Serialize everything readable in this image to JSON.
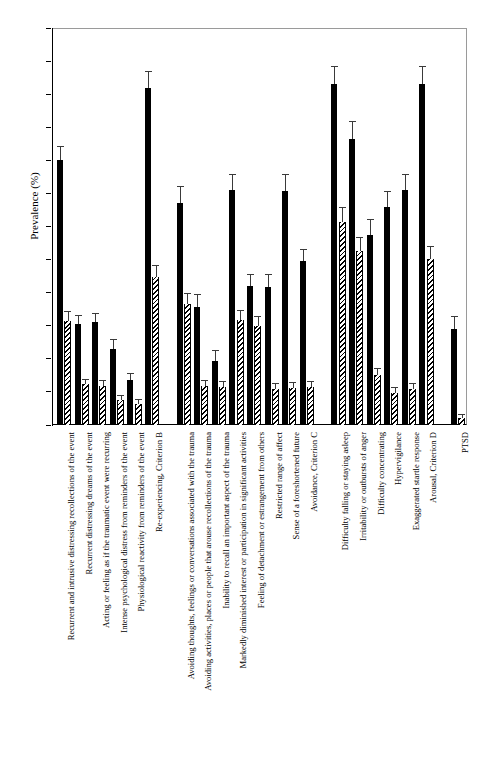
{
  "chart_data": {
    "type": "bar",
    "title": "",
    "xlabel": "",
    "ylabel": "Prevalence (%)",
    "ylim": [
      0,
      24
    ],
    "ytick_step": 2,
    "yticks": [
      0,
      2,
      4,
      6,
      8,
      10,
      12,
      14,
      16,
      18,
      20,
      22,
      24
    ],
    "grid": false,
    "legend": "none",
    "orientation": "vertical",
    "error_bars": "standard error (whisker with top cap)",
    "categories": [
      "Recurrent and intrusive distressing recollections of the event",
      "Recurrent distressing dreams of the event",
      "Acting or feeling as if the traumatic event were recurring",
      "Intense psychological distress from reminders of the event",
      "Physiological reactivity from reminders of the event",
      "Re-experiencing, Criterion B",
      "Avoiding thoughts, feelings or conversations associated with the trauma",
      "Avoiding activities, places or people that arouse recollections of the trauma",
      "Inability to recall an important aspect of the trauma",
      "Markedly diminished interest or participation in significant activities",
      "Feeling of detachment or estrangement from others",
      "Restricted range of affect",
      "Sense of a foreshortened future",
      "Avoidance, Criterion C",
      "Difficulty falling or staying asleep",
      "Irritability or outbursts of anger",
      "Difficulty concentrating",
      "Hypervigilance",
      "Exaggerated startle response",
      "Arousal, Criterion D",
      "PTSD"
    ],
    "series": [
      {
        "name": "solid-black-series",
        "fill": "solid",
        "values": [
          16.0,
          6.1,
          6.2,
          4.6,
          2.7,
          20.4,
          13.45,
          7.15,
          3.85,
          14.2,
          8.4,
          8.35,
          14.15,
          9.9,
          20.6,
          17.3,
          11.5,
          13.2,
          14.2,
          20.6,
          5.8
        ],
        "errors": [
          0.85,
          0.55,
          0.6,
          0.6,
          0.45,
          1.0,
          1.0,
          0.75,
          0.7,
          1.0,
          0.75,
          0.8,
          1.05,
          0.75,
          1.1,
          1.05,
          0.95,
          0.95,
          1.0,
          1.1,
          0.8
        ]
      },
      {
        "name": "hatched-series",
        "fill": "diagonal-hatch",
        "values": [
          6.3,
          2.45,
          2.35,
          1.5,
          1.25,
          8.95,
          7.3,
          2.35,
          2.3,
          6.35,
          6.0,
          2.2,
          2.25,
          2.3,
          12.3,
          10.5,
          3.0,
          1.95,
          2.2,
          10.05,
          0.4
        ],
        "errors": [
          0.6,
          0.35,
          0.35,
          0.3,
          0.3,
          0.7,
          0.7,
          0.35,
          0.35,
          0.6,
          0.6,
          0.35,
          0.35,
          0.35,
          0.9,
          0.85,
          0.45,
          0.35,
          0.35,
          0.8,
          0.25
        ]
      }
    ],
    "group_breaks_after": [
      5,
      13,
      19
    ]
  },
  "axis": {
    "y_title": "Prevalence (%)"
  }
}
